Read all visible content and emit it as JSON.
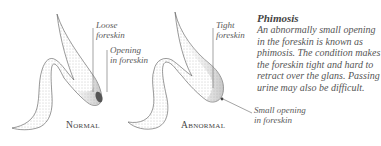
{
  "figures": [
    {
      "id": "normal",
      "caption": "Normal",
      "labels": [
        {
          "text_line1": "Loose",
          "text_line2": "foreskin"
        },
        {
          "text_line1": "Opening",
          "text_line2": "in foreskin"
        }
      ]
    },
    {
      "id": "abnormal",
      "caption": "Abnormal",
      "labels": [
        {
          "text_line1": "Tight",
          "text_line2": "foreskin"
        },
        {
          "text_line1": "Small opening",
          "text_line2": "in foreskin"
        }
      ]
    }
  ],
  "info": {
    "title": "Phimosis",
    "description": "An abnormally small opening in the foreskin is known as phimosis. The condition makes the foreskin tight and hard to retract over the glans. Passing urine may also be difficult."
  },
  "colors": {
    "ink": "#444444",
    "stipple": "#9a9a9a",
    "background": "#ffffff"
  }
}
